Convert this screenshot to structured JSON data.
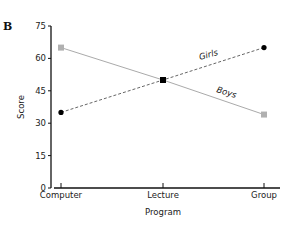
{
  "panel_label": "B",
  "chart_data": {
    "type": "line",
    "title": "",
    "xlabel": "Program",
    "ylabel": "Score",
    "categories": [
      "Computer",
      "Lecture",
      "Group"
    ],
    "ylim": [
      0,
      75
    ],
    "yticks": [
      0,
      15,
      30,
      45,
      60,
      75
    ],
    "ytick_labels": [
      "0",
      "15",
      "30",
      "45",
      "60",
      "75"
    ],
    "grid": false,
    "legend": "inline labels on lines",
    "series": [
      {
        "name": "Girls",
        "values": [
          35,
          50,
          65
        ],
        "line_style": "dashed",
        "marker": "circle",
        "color": "#000000"
      },
      {
        "name": "Boys",
        "values": [
          65,
          50,
          34
        ],
        "line_style": "solid",
        "marker": "square",
        "color": "#aaaaaa"
      }
    ]
  },
  "colors": {
    "axis": "#111111",
    "girls_line": "#555555",
    "girls_marker": "#000000",
    "boys_line": "#aaaaaa",
    "boys_marker": "#b0b0b0"
  }
}
